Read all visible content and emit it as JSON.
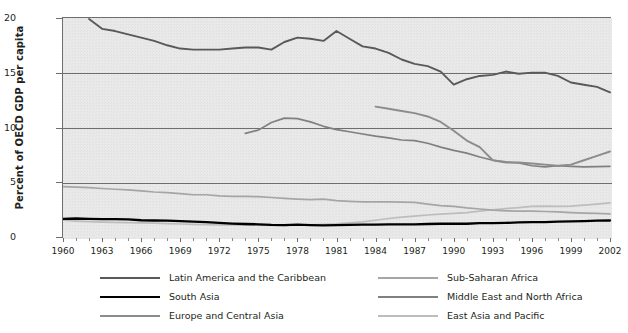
{
  "axes": {
    "ylabel": "Percent of OECD GDP per capita",
    "yticks": [
      "0",
      "5",
      "10",
      "15",
      "20"
    ],
    "xticks": [
      "1960",
      "1963",
      "1966",
      "1969",
      "1972",
      "1975",
      "1978",
      "1981",
      "1984",
      "1987",
      "1990",
      "1993",
      "1996",
      "1999",
      "2002"
    ]
  },
  "legend": {
    "items": [
      {
        "label": "Latin America and the Caribbean",
        "color": "#595959"
      },
      {
        "label": "South Asia",
        "color": "#000000"
      },
      {
        "label": "Europe and Central Asia",
        "color": "#8c8c8c"
      },
      {
        "label": "Sub-Saharan Africa",
        "color": "#a5a5a5"
      },
      {
        "label": "Middle East and North Africa",
        "color": "#808080"
      },
      {
        "label": "East Asia and Pacific",
        "color": "#bdbdbd"
      }
    ]
  },
  "chart_data": {
    "type": "line",
    "title": "",
    "xlabel": "",
    "ylabel": "Percent of OECD GDP per capita",
    "xlim": [
      1960,
      2002
    ],
    "ylim": [
      0,
      20
    ],
    "grid": "horizontal",
    "legend_position": "bottom",
    "x": [
      1960,
      1961,
      1962,
      1963,
      1964,
      1965,
      1966,
      1967,
      1968,
      1969,
      1970,
      1971,
      1972,
      1973,
      1974,
      1975,
      1976,
      1977,
      1978,
      1979,
      1980,
      1981,
      1982,
      1983,
      1984,
      1985,
      1986,
      1987,
      1988,
      1989,
      1990,
      1991,
      1992,
      1993,
      1994,
      1995,
      1996,
      1997,
      1998,
      1999,
      2000,
      2001,
      2002
    ],
    "series": [
      {
        "name": "Latin America and the Caribbean",
        "color": "#595959",
        "width": 1.9,
        "values": [
          null,
          null,
          20.0,
          19.1,
          18.9,
          18.6,
          18.3,
          18.0,
          17.6,
          17.3,
          17.2,
          17.2,
          17.2,
          17.3,
          17.4,
          17.4,
          17.2,
          17.9,
          18.3,
          18.2,
          18.0,
          18.9,
          18.2,
          17.5,
          17.3,
          16.9,
          16.3,
          15.9,
          15.7,
          15.2,
          14.0,
          14.5,
          14.8,
          14.9,
          15.2,
          15.0,
          15.1,
          15.1,
          14.8,
          14.2,
          14.0,
          13.8,
          13.3
        ]
      },
      {
        "name": "South Asia",
        "color": "#000000",
        "width": 2.3,
        "values": [
          1.75,
          1.78,
          1.75,
          1.72,
          1.72,
          1.7,
          1.62,
          1.6,
          1.58,
          1.55,
          1.5,
          1.45,
          1.38,
          1.32,
          1.28,
          1.25,
          1.2,
          1.18,
          1.22,
          1.18,
          1.15,
          1.18,
          1.2,
          1.22,
          1.22,
          1.25,
          1.25,
          1.25,
          1.28,
          1.3,
          1.32,
          1.3,
          1.35,
          1.35,
          1.38,
          1.42,
          1.45,
          1.45,
          1.5,
          1.52,
          1.55,
          1.58,
          1.6
        ]
      },
      {
        "name": "Europe and Central Asia",
        "color": "#8c8c8c",
        "width": 1.9,
        "values": [
          null,
          null,
          null,
          null,
          null,
          null,
          null,
          null,
          null,
          null,
          null,
          null,
          null,
          null,
          null,
          null,
          null,
          null,
          null,
          null,
          null,
          null,
          null,
          null,
          12.0,
          11.8,
          11.6,
          11.4,
          11.1,
          10.6,
          9.8,
          8.9,
          8.3,
          7.1,
          6.9,
          6.9,
          6.8,
          6.7,
          6.6,
          6.7,
          7.1,
          7.5,
          7.9
        ]
      },
      {
        "name": "Sub-Saharan Africa",
        "color": "#a5a5a5",
        "width": 1.7,
        "values": [
          4.7,
          4.65,
          4.6,
          4.52,
          4.45,
          4.4,
          4.3,
          4.2,
          4.15,
          4.05,
          3.95,
          3.95,
          3.85,
          3.8,
          3.8,
          3.78,
          3.7,
          3.62,
          3.55,
          3.5,
          3.55,
          3.42,
          3.35,
          3.3,
          3.3,
          3.3,
          3.28,
          3.25,
          3.1,
          2.95,
          2.88,
          2.75,
          2.65,
          2.55,
          2.48,
          2.45,
          2.45,
          2.42,
          2.38,
          2.32,
          2.28,
          2.25,
          2.2
        ]
      },
      {
        "name": "Middle East and North Africa",
        "color": "#808080",
        "width": 1.7,
        "values": [
          null,
          null,
          null,
          null,
          null,
          null,
          null,
          null,
          null,
          null,
          null,
          null,
          null,
          null,
          9.55,
          9.85,
          10.55,
          10.95,
          10.9,
          10.6,
          10.2,
          9.9,
          9.7,
          9.5,
          9.3,
          9.15,
          8.95,
          8.9,
          8.65,
          8.3,
          8.0,
          7.75,
          7.4,
          7.1,
          6.95,
          6.85,
          6.6,
          6.5,
          6.6,
          6.55,
          6.5,
          6.52,
          6.55
        ]
      },
      {
        "name": "East Asia and Pacific",
        "color": "#bdbdbd",
        "width": 1.7,
        "values": [
          1.62,
          1.55,
          1.5,
          1.45,
          1.42,
          1.4,
          1.38,
          1.35,
          1.32,
          1.28,
          1.25,
          1.22,
          1.2,
          1.2,
          1.18,
          1.18,
          1.15,
          1.15,
          1.18,
          1.2,
          1.25,
          1.3,
          1.38,
          1.48,
          1.62,
          1.78,
          1.9,
          2.0,
          2.1,
          2.18,
          2.25,
          2.32,
          2.45,
          2.58,
          2.68,
          2.78,
          2.88,
          2.92,
          2.88,
          2.92,
          3.0,
          3.1,
          3.2
        ]
      }
    ]
  }
}
